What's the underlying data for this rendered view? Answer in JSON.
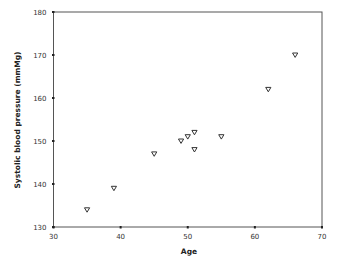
{
  "chart_data": {
    "type": "scatter",
    "title": "",
    "xlabel": "Age",
    "ylabel": "Systolic blood pressure (mmMg)",
    "xlim": [
      30,
      70
    ],
    "ylim": [
      130,
      180
    ],
    "x_ticks": [
      30,
      40,
      50,
      60,
      70
    ],
    "y_ticks": [
      130,
      140,
      150,
      160,
      170,
      180
    ],
    "grid": false,
    "legend": null,
    "marker": "triangle-down",
    "series": [
      {
        "name": "Systolic blood pressure",
        "points": [
          {
            "x": 35,
            "y": 134
          },
          {
            "x": 39,
            "y": 139
          },
          {
            "x": 45,
            "y": 147
          },
          {
            "x": 49,
            "y": 150
          },
          {
            "x": 50,
            "y": 151
          },
          {
            "x": 51,
            "y": 152
          },
          {
            "x": 51,
            "y": 148
          },
          {
            "x": 55,
            "y": 151
          },
          {
            "x": 62,
            "y": 162
          },
          {
            "x": 66,
            "y": 170
          }
        ]
      }
    ]
  },
  "colors": {
    "axis": "#555555",
    "marker_stroke": "#333333",
    "background": "#ffffff"
  }
}
